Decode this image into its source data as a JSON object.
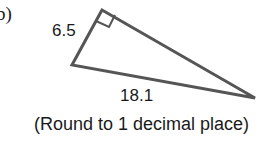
{
  "problem": {
    "part_label": "b)",
    "instruction": "(Round to 1 decimal place)"
  },
  "triangle": {
    "type": "right triangle",
    "right_angle_marker": true,
    "stroke_color": "#555555",
    "sides": [
      {
        "label": "6.5",
        "position": "left leg"
      },
      {
        "label": "18.1",
        "position": "bottom side"
      }
    ]
  }
}
